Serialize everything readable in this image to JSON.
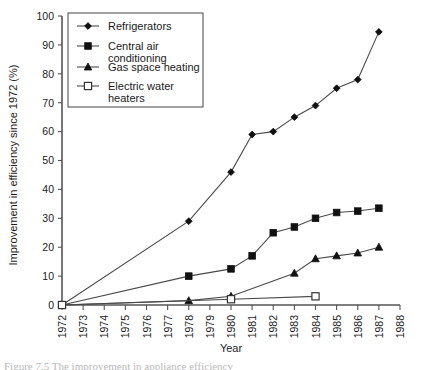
{
  "chart_data": {
    "type": "line",
    "title": "",
    "xlabel": "Year",
    "ylabel": "Improvement in efficiency since 1972 (%)",
    "xlim": [
      1972,
      1988
    ],
    "ylim": [
      0,
      100
    ],
    "x_ticks": [
      1972,
      1973,
      1974,
      1975,
      1976,
      1977,
      1978,
      1979,
      1980,
      1981,
      1982,
      1983,
      1984,
      1985,
      1986,
      1987,
      1988
    ],
    "y_ticks": [
      0,
      10,
      20,
      30,
      40,
      50,
      60,
      70,
      80,
      90,
      100
    ],
    "grid": false,
    "legend_position": "upper-left-inside",
    "series": [
      {
        "name": "Refrigerators",
        "marker": "diamond-filled",
        "x": [
          1972,
          1978,
          1980,
          1981,
          1982,
          1983,
          1984,
          1985,
          1986,
          1987
        ],
        "values": [
          0,
          29,
          46,
          59,
          60,
          65,
          69,
          75,
          78,
          94.5
        ]
      },
      {
        "name": "Central air conditioning",
        "marker": "square-filled",
        "x": [
          1972,
          1978,
          1980,
          1981,
          1982,
          1983,
          1984,
          1985,
          1986,
          1987
        ],
        "values": [
          0,
          10,
          12.5,
          17,
          25,
          27,
          30,
          32,
          32.5,
          33.5
        ]
      },
      {
        "name": "Gas space heating",
        "marker": "triangle-filled",
        "x": [
          1972,
          1978,
          1980,
          1983,
          1984,
          1985,
          1986,
          1987
        ],
        "values": [
          0,
          1.5,
          3,
          11,
          16,
          17,
          18,
          20
        ]
      },
      {
        "name": "Electric water heaters",
        "marker": "square-open",
        "x": [
          1972,
          1980,
          1984
        ],
        "values": [
          0,
          2,
          3
        ]
      }
    ]
  },
  "legend": {
    "entries": [
      {
        "label_line1": "Refrigerators",
        "label_line2": ""
      },
      {
        "label_line1": "Central air",
        "label_line2": "conditioning"
      },
      {
        "label_line1": "Gas space heating",
        "label_line2": ""
      },
      {
        "label_line1": "Electric water",
        "label_line2": "heaters"
      }
    ]
  },
  "axes": {
    "x_title": "Year",
    "y_title": "Improvement in efficiency since 1972 (%)"
  },
  "caption": {
    "text": "Figure  7.5  The improvement in appliance efficiency"
  },
  "colors": {
    "marker": "#111111",
    "line": "#4a4a4a",
    "axis": "#555555",
    "background": "#ffffff"
  }
}
